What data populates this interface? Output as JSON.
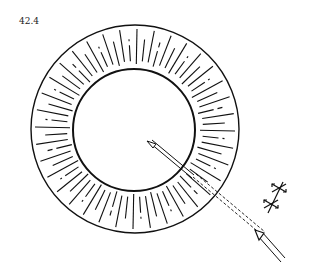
{
  "figure": {
    "label": "42.4",
    "colors": {
      "stroke": "#111111",
      "background": "#ffffff"
    },
    "ring": {
      "cx": 135,
      "cy": 129,
      "outer_r": 104,
      "inner_r": 61,
      "radial_lines": 72
    },
    "beam": {
      "tip": [
        150,
        143
      ],
      "end": [
        283,
        262
      ],
      "polarization_markers": 2
    }
  }
}
